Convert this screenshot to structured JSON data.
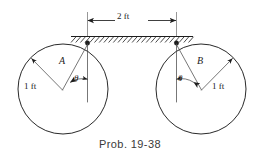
{
  "figure": {
    "caption": "Prob. 19-38",
    "dimension": {
      "label": "2 ft",
      "value": 2,
      "unit": "ft"
    },
    "support": {
      "name": "fixed-hatched-ceiling",
      "hatch_count": 26
    },
    "bodies": [
      {
        "id": "A",
        "label": "A",
        "radius_label": "1 ft",
        "radius_value": 1,
        "radius_unit": "ft",
        "angle_label": "θ",
        "side": "left"
      },
      {
        "id": "B",
        "label": "B",
        "radius_label": "1 ft",
        "radius_value": 1,
        "radius_unit": "ft",
        "angle_label": "θ",
        "side": "right"
      }
    ],
    "colors": {
      "ink": "#1d1d1d",
      "thin_ink": "#4a4a4a",
      "caption": "#3a3a3a",
      "background": "#ffffff"
    }
  }
}
